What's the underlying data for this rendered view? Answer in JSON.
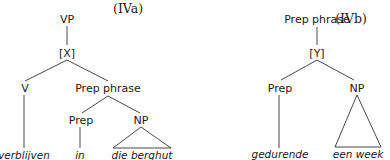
{
  "diagrams": [
    {
      "id": "IVa",
      "tag": "(IVa)",
      "nodes": {
        "root": "VP",
        "intermediate": "[X]",
        "left": "V",
        "right": "Prep phrase",
        "prep": "Prep",
        "np": "NP"
      },
      "terminals": {
        "verb": "verblijven",
        "prep": "in",
        "np": "die berghut"
      }
    },
    {
      "id": "IVb",
      "tag": "(IVb)",
      "nodes": {
        "root": "Prep phrase",
        "intermediate": "[Y]",
        "prep": "Prep",
        "np": "NP"
      },
      "terminals": {
        "prep": "gedurende",
        "np": "een week"
      }
    }
  ]
}
